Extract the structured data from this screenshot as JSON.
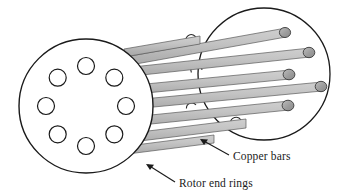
{
  "figure": {
    "background_color": "#ffffff",
    "width": 342,
    "height": 196
  },
  "labels": [
    {
      "id": "copper-bars",
      "text": "Copper bars",
      "x": 232,
      "y": 159,
      "leader_from": [
        228,
        154
      ],
      "leader_to": [
        201,
        139
      ]
    },
    {
      "id": "rotor-end-rings",
      "text": "Rotor end rings",
      "x": 178,
      "y": 186,
      "leader_from": [
        174,
        181
      ],
      "leader_to": [
        146,
        164
      ]
    }
  ],
  "left_end_ring": {
    "name": "Rotor end ring (front)",
    "center_x": 86,
    "center_y": 106,
    "radius": 67,
    "stroke": "#1a1a1a",
    "stroke_width": 1.3,
    "fill": "#ffffff",
    "hole_count": 8,
    "hole_radius": 8.5,
    "hole_ring_radius": 40,
    "hole_stroke": "#1a1a1a",
    "hole_fill": "#ffffff"
  },
  "right_end_ring": {
    "name": "Rotor end ring (back)",
    "center_x": 264,
    "center_y": 74,
    "radius": 66,
    "stroke": "#1a1a1a",
    "stroke_width": 1.3,
    "fill": "none"
  },
  "copper_bars": {
    "name": "Copper bars",
    "count": 8,
    "fill_light": "#d6d6d6",
    "fill_mid": "#bdbdbd",
    "fill_dark": "#a8a8a8",
    "cap_fill": "#9a9a9a",
    "stroke": "#4a4a4a",
    "stroke_width": 0.8,
    "thickness": 9,
    "axis_dx": 178,
    "axis_dy": -32,
    "visible_front_caps": 4,
    "hidden_back_caps": 4
  },
  "colors": {
    "ink": "#1a1a1a",
    "bar_gray": "#bdbdbd",
    "cap_gray": "#9a9a9a",
    "paper": "#ffffff"
  }
}
